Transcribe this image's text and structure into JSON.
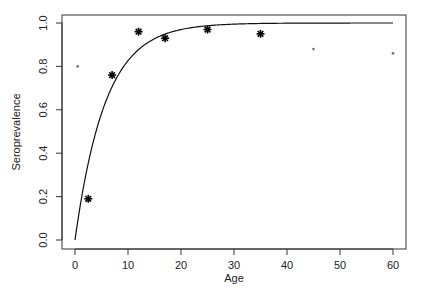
{
  "chart_data": {
    "type": "scatter",
    "title": "",
    "xlabel": "Age",
    "ylabel": "Seroprevalence",
    "xlim": [
      -2.5,
      62.5
    ],
    "ylim": [
      -0.04,
      1.04
    ],
    "x_ticks": [
      0,
      10,
      20,
      30,
      40,
      50,
      60
    ],
    "x_tick_labels": [
      "0",
      "10",
      "20",
      "30",
      "40",
      "50",
      "60"
    ],
    "y_ticks": [
      0.0,
      0.2,
      0.4,
      0.6,
      0.8,
      1.0
    ],
    "y_tick_labels": [
      "0.0",
      "0.2",
      "0.4",
      "0.6",
      "0.8",
      "1.0"
    ],
    "grid": false,
    "legend": null,
    "series": [
      {
        "name": "observed (large stars)",
        "marker": "asterisk",
        "size": "large",
        "x": [
          2.5,
          7,
          12,
          17,
          25,
          35
        ],
        "y": [
          0.19,
          0.76,
          0.96,
          0.93,
          0.97,
          0.95
        ]
      },
      {
        "name": "observed (small dots)",
        "marker": "dot",
        "size": "small",
        "x": [
          0.5,
          45,
          60
        ],
        "y": [
          0.8,
          0.88,
          0.86
        ]
      },
      {
        "name": "fitted curve",
        "type": "line",
        "model": "1 - exp(-lambda * age)",
        "lambda": 0.175,
        "x_range": [
          0,
          60
        ]
      }
    ]
  },
  "labels": {
    "xlabel": "Age",
    "ylabel": "Seroprevalence"
  }
}
